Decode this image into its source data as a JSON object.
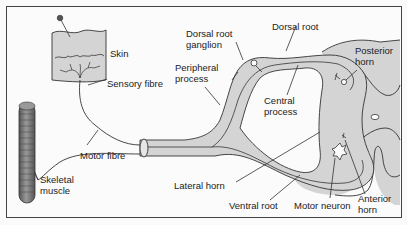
{
  "diagram": {
    "type": "reflex-arc-anatomy",
    "colors": {
      "tissue_fill": "#d4d4d4",
      "stroke": "#333333",
      "background": "#fbfbfb",
      "muscle": "#777777"
    },
    "labels": {
      "skin": "Skin",
      "sensory_fibre": "Sensory fibre",
      "dorsal_root_ganglion_1": "Dorsal root",
      "dorsal_root_ganglion_2": "ganglion",
      "peripheral_process_1": "Peripheral",
      "peripheral_process_2": "process",
      "dorsal_root": "Dorsal root",
      "posterior_horn_1": "Posterior",
      "posterior_horn_2": "horn",
      "central_process_1": "Central",
      "central_process_2": "process",
      "motor_fibre": "Motor fibre",
      "skeletal_muscle_1": "Skeletal",
      "skeletal_muscle_2": "muscle",
      "lateral_horn": "Lateral horn",
      "ventral_root": "Ventral root",
      "motor_neuron": "Motor neuron",
      "anterior_horn_1": "Anterior",
      "anterior_horn_2": "horn"
    }
  }
}
